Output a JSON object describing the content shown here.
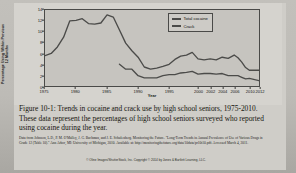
{
  "figure": {
    "caption": "Figure 10-1: Trends in cocaine and crack use by high school seniors, 1975-2010. These data represent the percentages of high school seniors surveyed who reported using cocaine during the year.",
    "source_note": "Data from Johnson, L.D., P. M. O'Malley, J. G. Bachman, and J. E. Schulenberg. Monitoring the Future. \"Long-Term Trends in Annual Prevalence of Use of Various Drugs in Grade 12 (Table 10).\" Ann Arbor, MI: University of Michigan, 2010. Available at: http://monitoringthefuture.org/data/10data/pr10t10.pdf. Accessed March 4, 2011.",
    "copyright": "© Oline Images/ShutterStock, Inc. Copyright © 2014 by Jones & Bartlett Learning, LLC."
  },
  "chart_data": {
    "type": "line",
    "title": "",
    "xlabel": "Year",
    "ylabel": "Percentage Using Within Previous 12 Months",
    "xlim": [
      1975,
      2012
    ],
    "ylim": [
      0,
      14
    ],
    "grid": false,
    "legend_position": "top-right",
    "line_color": "#4b4b49",
    "plot_background": "#c6c4bf",
    "yticks": [
      0,
      2,
      4,
      6,
      8,
      10,
      12,
      14
    ],
    "xticks": [
      1975,
      1980,
      1985,
      1990,
      1995,
      2000,
      2002,
      2004,
      2006,
      2010,
      2012
    ],
    "xtick_labels": [
      "1975",
      "1980",
      "1985",
      "1990",
      "1995",
      "2000",
      "2002",
      "2004",
      "2006",
      "2010",
      "2012"
    ],
    "series": [
      {
        "name": "Total cocaine",
        "x": [
          1975,
          1976,
          1977,
          1978,
          1979,
          1980,
          1981,
          1982,
          1983,
          1984,
          1985,
          1986,
          1987,
          1988,
          1989,
          1990,
          1991,
          1992,
          1993,
          1994,
          1995,
          1996,
          1997,
          1998,
          1999,
          2000,
          2001,
          2002,
          2003,
          2004,
          2005,
          2006,
          2007,
          2008,
          2009,
          2010,
          2012
        ],
        "values": [
          5.6,
          6.0,
          7.2,
          9.0,
          12.0,
          12.1,
          12.4,
          11.5,
          11.4,
          11.6,
          13.1,
          12.7,
          10.3,
          7.9,
          6.5,
          5.3,
          3.5,
          3.1,
          3.3,
          3.6,
          4.0,
          4.9,
          5.5,
          5.7,
          6.2,
          5.0,
          4.8,
          5.0,
          4.8,
          5.3,
          5.1,
          5.7,
          5.2,
          4.4,
          3.4,
          2.9,
          2.9
        ]
      },
      {
        "name": "Crack",
        "x": [
          1987,
          1988,
          1989,
          1990,
          1991,
          1992,
          1993,
          1994,
          1995,
          1996,
          1997,
          1998,
          1999,
          2000,
          2001,
          2002,
          2003,
          2004,
          2005,
          2006,
          2007,
          2008,
          2009,
          2010,
          2012
        ],
        "values": [
          4.0,
          3.1,
          3.1,
          1.9,
          1.5,
          1.5,
          1.5,
          1.9,
          2.1,
          2.1,
          2.4,
          2.5,
          2.7,
          2.2,
          2.3,
          2.3,
          2.2,
          2.3,
          1.9,
          1.9,
          1.9,
          1.6,
          1.3,
          1.4,
          1.0
        ]
      }
    ],
    "legend": [
      {
        "label": "Total cocaine"
      },
      {
        "label": "Crack"
      }
    ]
  }
}
